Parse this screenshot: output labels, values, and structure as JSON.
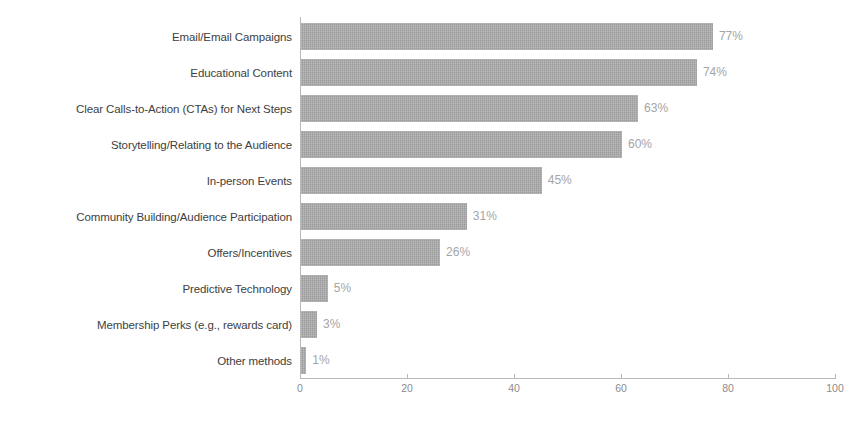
{
  "chart_data": {
    "type": "bar",
    "orientation": "horizontal",
    "title": "",
    "xlabel": "",
    "ylabel": "",
    "xlim": [
      0,
      100
    ],
    "xticks": [
      "0",
      "20",
      "40",
      "60",
      "80",
      "100"
    ],
    "grid": false,
    "legend": null,
    "value_suffix": "%",
    "categories": [
      "Email/Email Campaigns",
      "Educational Content",
      "Clear Calls-to-Action (CTAs) for Next Steps",
      "Storytelling/Relating to the Audience",
      "In-person Events",
      "Community Building/Audience Participation",
      "Offers/Incentives",
      "Predictive Technology",
      "Membership Perks (e.g., rewards card)",
      "Other methods"
    ],
    "values": [
      77,
      74,
      63,
      60,
      45,
      31,
      26,
      5,
      3,
      1
    ],
    "value_labels": [
      "77%",
      "74%",
      "63%",
      "60%",
      "45%",
      "31%",
      "26%",
      "5%",
      "3%",
      "1%"
    ],
    "colors": {
      "bar": "#9b9b9b",
      "value_label": "#a5a5a5",
      "category_label": "#3e3e3e",
      "axis": "#b9b9b9",
      "tick_label": "#8c8c8c",
      "background": "#ffffff"
    }
  }
}
